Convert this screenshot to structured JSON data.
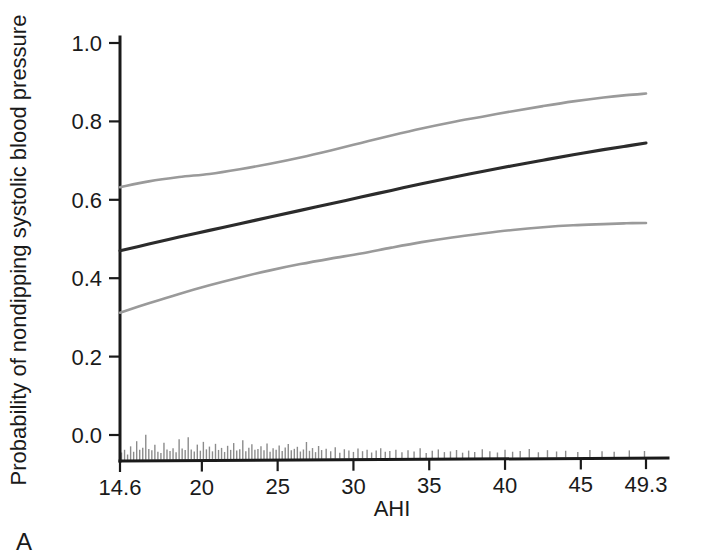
{
  "panel": {
    "label": "A"
  },
  "chart_data": {
    "type": "line",
    "title": "",
    "xlabel": "AHI",
    "ylabel": "Probability of nondipping systolic blood pressure",
    "xlim": [
      14.6,
      49.3
    ],
    "ylim": [
      0.0,
      1.0
    ],
    "grid": false,
    "legend_position": "none",
    "xticks": [
      14.6,
      20,
      25,
      30,
      35,
      40,
      45,
      49.3
    ],
    "xticklabels": [
      "14.6",
      "20",
      "25",
      "30",
      "35",
      "40",
      "45",
      "49.3"
    ],
    "yticks": [
      0.0,
      0.2,
      0.4,
      0.6,
      0.8,
      1.0
    ],
    "yticklabels": [
      "0.0",
      "0.2",
      "0.4",
      "0.6",
      "0.8",
      "1.0"
    ],
    "colors": {
      "fit": "#2b2b2b",
      "confidence_interval": "#9a9a9a",
      "axis": "#1a1a1a",
      "rug": "#8c8c8c"
    },
    "series": [
      {
        "name": "Upper 95% confidence limit",
        "style": "solid-gray",
        "color": "#9a9a9a",
        "x": [
          14.6,
          16.5,
          18.5,
          20.5,
          22.5,
          24.5,
          26.5,
          28.5,
          30.5,
          32.5,
          34.5,
          36.5,
          38.5,
          40.5,
          42.5,
          44.5,
          46.5,
          48.0,
          49.3
        ],
        "values": [
          0.632,
          0.647,
          0.658,
          0.666,
          0.678,
          0.692,
          0.708,
          0.726,
          0.745,
          0.764,
          0.782,
          0.798,
          0.812,
          0.826,
          0.839,
          0.851,
          0.861,
          0.867,
          0.871
        ]
      },
      {
        "name": "Predicted probability",
        "style": "solid-black",
        "color": "#2b2b2b",
        "x": [
          14.6,
          16.5,
          18.5,
          20.5,
          22.5,
          24.5,
          26.5,
          28.5,
          30.5,
          32.5,
          34.5,
          36.5,
          38.5,
          40.5,
          42.5,
          44.5,
          46.5,
          48.0,
          49.3
        ],
        "values": [
          0.47,
          0.487,
          0.505,
          0.522,
          0.539,
          0.556,
          0.573,
          0.59,
          0.607,
          0.624,
          0.641,
          0.657,
          0.672,
          0.687,
          0.701,
          0.715,
          0.728,
          0.737,
          0.745
        ]
      },
      {
        "name": "Lower 95% confidence limit",
        "style": "solid-gray",
        "color": "#9a9a9a",
        "x": [
          14.6,
          16.5,
          18.5,
          20.5,
          22.5,
          24.5,
          26.5,
          28.5,
          30.5,
          32.5,
          34.5,
          36.5,
          38.5,
          40.5,
          42.5,
          44.5,
          46.5,
          48.0,
          49.3
        ],
        "values": [
          0.312,
          0.336,
          0.36,
          0.382,
          0.402,
          0.42,
          0.436,
          0.45,
          0.463,
          0.478,
          0.492,
          0.504,
          0.514,
          0.523,
          0.53,
          0.535,
          0.538,
          0.54,
          0.541
        ]
      }
    ],
    "rug": {
      "name": "AHI observation rug",
      "description": "Vertical gray tick marks along the x-axis showing the distribution of AHI observations",
      "x": [
        14.7,
        14.9,
        15.1,
        15.3,
        15.5,
        15.7,
        15.9,
        16.1,
        16.3,
        16.5,
        16.7,
        16.9,
        17.1,
        17.3,
        17.5,
        17.7,
        17.9,
        18.1,
        18.3,
        18.5,
        18.7,
        18.9,
        19.1,
        19.3,
        19.5,
        19.7,
        19.9,
        20.1,
        20.3,
        20.5,
        20.7,
        20.9,
        21.1,
        21.3,
        21.5,
        21.7,
        21.9,
        22.1,
        22.3,
        22.5,
        22.7,
        22.9,
        23.1,
        23.3,
        23.5,
        23.7,
        23.9,
        24.1,
        24.3,
        24.5,
        24.7,
        24.9,
        25.1,
        25.3,
        25.5,
        25.7,
        25.9,
        26.1,
        26.3,
        26.5,
        26.7,
        26.9,
        27.1,
        27.3,
        27.5,
        27.7,
        27.9,
        28.2,
        28.5,
        28.8,
        29.1,
        29.4,
        29.7,
        30.0,
        30.3,
        30.6,
        30.9,
        31.2,
        31.5,
        31.8,
        32.1,
        32.4,
        32.8,
        33.2,
        33.6,
        34.0,
        34.4,
        34.8,
        35.2,
        35.6,
        36.0,
        36.4,
        36.8,
        37.2,
        37.6,
        38.0,
        38.5,
        39.0,
        39.5,
        40.0,
        40.5,
        41.0,
        41.6,
        42.2,
        42.8,
        43.4,
        44.0,
        44.8,
        45.6,
        46.4,
        47.2,
        48.2,
        49.2
      ],
      "heights": [
        0.22,
        0.3,
        0.16,
        0.4,
        0.24,
        0.55,
        0.3,
        0.36,
        0.74,
        0.32,
        0.28,
        0.44,
        0.24,
        0.2,
        0.5,
        0.3,
        0.26,
        0.34,
        0.22,
        0.6,
        0.33,
        0.28,
        0.66,
        0.3,
        0.24,
        0.44,
        0.26,
        0.52,
        0.3,
        0.38,
        0.24,
        0.46,
        0.28,
        0.34,
        0.22,
        0.4,
        0.28,
        0.48,
        0.26,
        0.3,
        0.56,
        0.24,
        0.34,
        0.44,
        0.28,
        0.3,
        0.38,
        0.26,
        0.46,
        0.22,
        0.32,
        0.28,
        0.4,
        0.24,
        0.34,
        0.44,
        0.26,
        0.3,
        0.36,
        0.22,
        0.28,
        0.5,
        0.24,
        0.32,
        0.2,
        0.38,
        0.26,
        0.3,
        0.22,
        0.34,
        0.18,
        0.28,
        0.24,
        0.2,
        0.3,
        0.22,
        0.26,
        0.18,
        0.24,
        0.3,
        0.2,
        0.22,
        0.26,
        0.18,
        0.24,
        0.2,
        0.3,
        0.16,
        0.22,
        0.26,
        0.18,
        0.2,
        0.24,
        0.16,
        0.22,
        0.18,
        0.26,
        0.2,
        0.16,
        0.24,
        0.18,
        0.2,
        0.26,
        0.16,
        0.22,
        0.18,
        0.2,
        0.16,
        0.22,
        0.18,
        0.16,
        0.2,
        0.18
      ]
    }
  }
}
